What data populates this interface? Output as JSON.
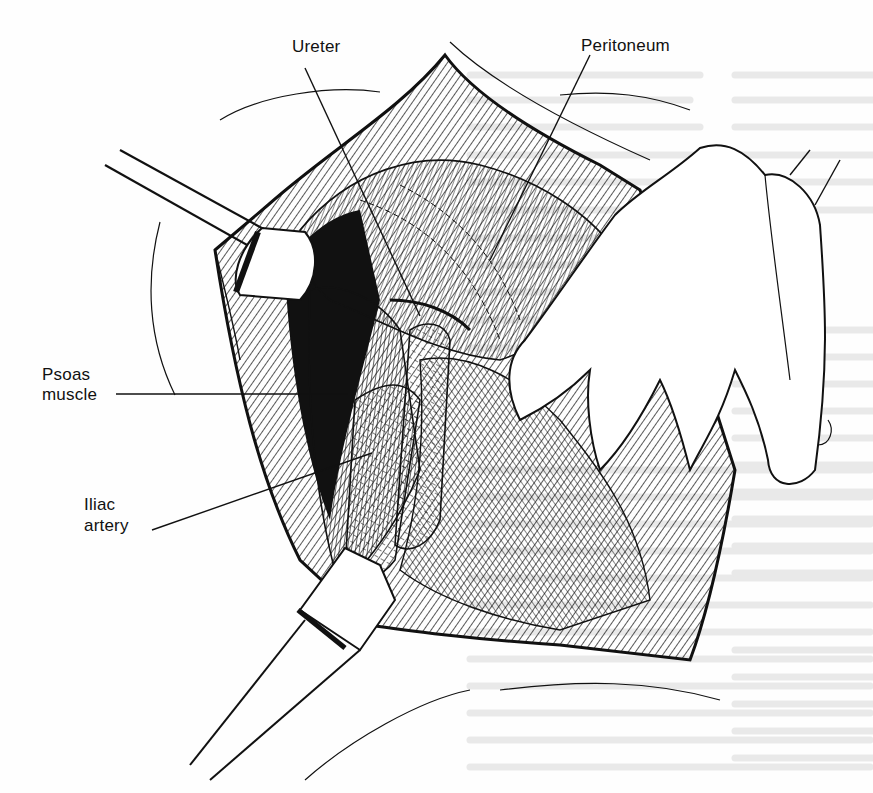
{
  "figure": {
    "labels": {
      "ureter": "Ureter",
      "peritoneum": "Peritoneum",
      "psoas": [
        "Psoas",
        "muscle"
      ],
      "iliac": [
        "Iliac",
        "artery"
      ]
    },
    "structures": [
      "retractor-upper-left",
      "retractor-lower-left",
      "surgeon-hand",
      "peritoneal-sac",
      "psoas-muscle",
      "iliac-artery",
      "ureter",
      "wound-edge"
    ]
  },
  "colors": {
    "ink": "#111111",
    "paper": "#fefefe",
    "bleed_through": "#e6e6e6"
  }
}
